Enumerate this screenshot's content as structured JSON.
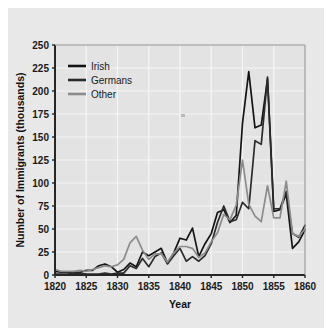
{
  "chart_data": {
    "type": "line",
    "title": "",
    "xlabel": "Year",
    "ylabel": "Number of Immigrants (thousands)",
    "xlim": [
      1820,
      1860
    ],
    "ylim": [
      0,
      250
    ],
    "xticks": [
      1820,
      1825,
      1830,
      1835,
      1840,
      1845,
      1850,
      1855,
      1860
    ],
    "yticks": [
      0,
      25,
      50,
      75,
      100,
      125,
      150,
      175,
      200,
      225,
      250
    ],
    "grid": true,
    "legend_position": "upper left",
    "x": [
      1820,
      1821,
      1822,
      1823,
      1824,
      1825,
      1826,
      1827,
      1828,
      1829,
      1830,
      1831,
      1832,
      1833,
      1834,
      1835,
      1836,
      1837,
      1838,
      1839,
      1840,
      1841,
      1842,
      1843,
      1844,
      1845,
      1846,
      1847,
      1848,
      1849,
      1850,
      1851,
      1852,
      1853,
      1854,
      1855,
      1856,
      1857,
      1858,
      1859,
      1860
    ],
    "series": [
      {
        "name": "Irish",
        "color": "#141414",
        "values": [
          4,
          3,
          3,
          3,
          3,
          5,
          5,
          10,
          12,
          9,
          3,
          6,
          13,
          9,
          25,
          21,
          25,
          29,
          13,
          24,
          40,
          38,
          51,
          20,
          34,
          45,
          68,
          71,
          57,
          65,
          165,
          221,
          160,
          163,
          213,
          69,
          71,
          88,
          29,
          36,
          49
        ],
        "linewidth": 1.7
      },
      {
        "name": "Germans",
        "color": "#2b2b2b",
        "values": [
          1,
          1,
          1,
          2,
          2,
          1,
          1,
          1,
          2,
          1,
          2,
          2,
          10,
          7,
          18,
          9,
          20,
          24,
          12,
          21,
          29,
          15,
          20,
          15,
          21,
          34,
          57,
          75,
          58,
          60,
          79,
          72,
          146,
          142,
          215,
          72,
          72,
          91,
          45,
          41,
          54
        ],
        "linewidth": 1.7
      },
      {
        "name": "Other",
        "color": "#8c8c8c",
        "values": [
          6,
          4,
          4,
          4,
          5,
          4,
          6,
          8,
          10,
          9,
          11,
          17,
          35,
          42,
          27,
          17,
          23,
          23,
          14,
          24,
          31,
          31,
          29,
          19,
          24,
          36,
          46,
          66,
          60,
          76,
          125,
          77,
          64,
          58,
          97,
          62,
          62,
          102,
          45,
          42,
          50
        ],
        "linewidth": 1.7
      }
    ]
  },
  "legend": {
    "items": [
      {
        "label": "Irish"
      },
      {
        "label": "Germans"
      },
      {
        "label": "Other"
      }
    ]
  },
  "axes": {
    "x_title": "Year",
    "y_title": "Number of Immigrants (thousands)",
    "x_tick_labels": [
      "1820",
      "1825",
      "1830",
      "1835",
      "1840",
      "1845",
      "1850",
      "1855",
      "1860"
    ],
    "y_tick_labels": [
      "0",
      "25",
      "50",
      "75",
      "100",
      "125",
      "150",
      "175",
      "200",
      "225",
      "250"
    ]
  },
  "colors": {
    "page_background": "#ffffff",
    "panel_background": "#e8e8e8",
    "plot_background": "#e3e3e3",
    "grid": "#f6f6f6",
    "axis": "#262626",
    "irish": "#141414",
    "germans": "#2b2b2b",
    "other": "#8c8c8c"
  }
}
